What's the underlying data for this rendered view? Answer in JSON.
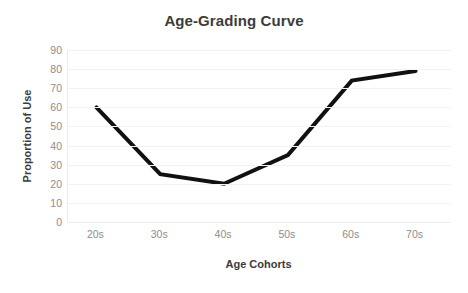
{
  "chart_data": {
    "type": "line",
    "title": "Age-Grading Curve",
    "xlabel": "Age Cohorts",
    "ylabel": "Proportion of Use",
    "categories": [
      "20s",
      "30s",
      "40s",
      "50s",
      "60s",
      "70s"
    ],
    "values": [
      60,
      25,
      20,
      35,
      74,
      79
    ],
    "series": [
      {
        "name": "Proportion of Use",
        "values": [
          60,
          25,
          20,
          35,
          74,
          79
        ]
      }
    ],
    "ylim": [
      0,
      90
    ],
    "ytick_labels": [
      "90",
      "80",
      "70",
      "60",
      "50",
      "40",
      "30",
      "20",
      "10",
      "0"
    ],
    "ytick_values": [
      90,
      80,
      70,
      60,
      50,
      40,
      30,
      20,
      10,
      0
    ],
    "ytick_step": 10,
    "grid": "horizontal",
    "legend": "none",
    "markers": "none",
    "line_color": "#111111",
    "line_width": 4,
    "grid_color": "#f2f2f2",
    "title_color": "#3b3b3b",
    "axis_label_color": "#3b3b3b",
    "tick_label_color": "#8d8d8d",
    "background_color": "#ffffff"
  }
}
